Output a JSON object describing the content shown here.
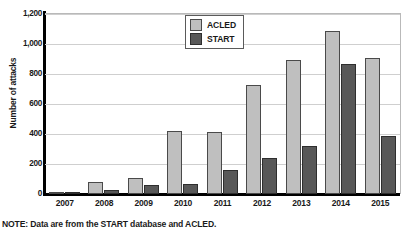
{
  "chart_data": {
    "type": "bar",
    "title": "",
    "xlabel": "",
    "ylabel": "Number of attacks",
    "categories": [
      "2007",
      "2008",
      "2009",
      "2010",
      "2011",
      "2012",
      "2013",
      "2014",
      "2015"
    ],
    "series": [
      {
        "name": "ACLED",
        "color": "#bfbfbf",
        "values": [
          8,
          80,
          105,
          420,
          415,
          725,
          895,
          1090,
          910
        ]
      },
      {
        "name": "START",
        "color": "#585858",
        "values": [
          12,
          28,
          58,
          65,
          160,
          240,
          320,
          865,
          390
        ]
      }
    ],
    "ylim": [
      0,
      1200
    ],
    "yticks": [
      0,
      200,
      400,
      600,
      800,
      1000,
      1200
    ],
    "ytick_labels": [
      "0",
      "200",
      "400",
      "600",
      "800",
      "1,000",
      "1,200"
    ],
    "grid": true,
    "legend_position": "top-center-left"
  },
  "legend": {
    "entries": [
      {
        "label": "ACLED"
      },
      {
        "label": "START"
      }
    ]
  },
  "note": "NOTE: Data are from the START database and ACLED."
}
